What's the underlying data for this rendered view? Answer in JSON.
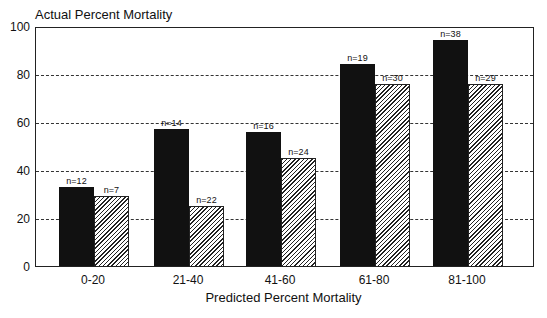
{
  "chart_data": {
    "type": "bar",
    "title": "",
    "ylabel": "Actual Percent Mortality",
    "xlabel": "Predicted Percent Mortality",
    "ylim": [
      0,
      100
    ],
    "yticks": [
      0,
      20,
      40,
      60,
      80,
      100
    ],
    "grid": "dashed horizontal at 20,40,60,80",
    "categories": [
      "0-20",
      "21-40",
      "41-60",
      "61-80",
      "81-100"
    ],
    "series": [
      {
        "name": "solid",
        "style": "black",
        "values": [
          33,
          57,
          56,
          84,
          94
        ],
        "n": [
          "n=12",
          "n=14",
          "n=16",
          "n=19",
          "n=38"
        ]
      },
      {
        "name": "hatched",
        "style": "hatched",
        "values": [
          29,
          25,
          45,
          76,
          76
        ],
        "n": [
          "n=7",
          "n=22",
          "n=24",
          "n=30",
          "n=29"
        ]
      }
    ]
  },
  "labels": {
    "ytitle": "Actual Percent Mortality",
    "xtitle": "Predicted Percent Mortality"
  }
}
